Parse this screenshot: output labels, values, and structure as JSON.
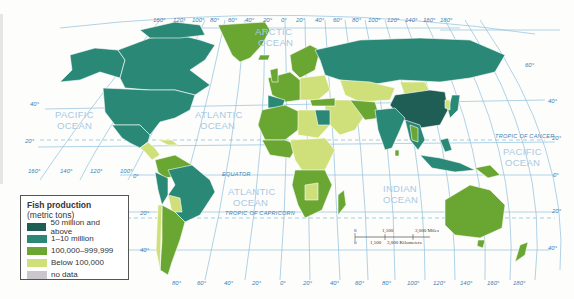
{
  "legend": {
    "title_line1": "Fish production",
    "title_line2": "(metric tons)",
    "items": [
      {
        "label": "50 million and above",
        "color": "#1e5e55"
      },
      {
        "label": "1–10 million",
        "color": "#2a8877"
      },
      {
        "label": "100,000–999,999",
        "color": "#6aa632"
      },
      {
        "label": "Below 100,000",
        "color": "#cfe07a"
      },
      {
        "label": "no data",
        "color": "#c9c7cc"
      }
    ]
  },
  "oceans": {
    "arctic_1": "ARCTIC",
    "arctic_2": "OCEAN",
    "pacific_w_1": "PACIFIC",
    "pacific_w_2": "OCEAN",
    "atlantic_n_1": "ATLANTIC",
    "atlantic_n_2": "OCEAN",
    "atlantic_s_1": "ATLANTIC",
    "atlantic_s_2": "OCEAN",
    "indian_1": "INDIAN",
    "indian_2": "OCEAN",
    "pacific_e_1": "PACIFIC",
    "pacific_e_2": "OCEAN"
  },
  "lines": {
    "equator": "EQUATOR",
    "tropic_cancer": "TROPIC OF CANCER",
    "tropic_capricorn": "TROPIC OF CAPRICORN"
  },
  "top_longitudes": [
    "160°",
    "120°",
    "100°",
    "80°",
    "60°",
    "40°",
    "20°",
    "0°",
    "20°",
    "40°",
    "60°",
    "80°",
    "100°",
    "120°",
    "140°",
    "160°",
    "180°"
  ],
  "bottom_longitudes": [
    "80°",
    "60°",
    "40°",
    "20°",
    "0°",
    "20°",
    "40°",
    "60°",
    "80°",
    "100°",
    "120°",
    "140°",
    "160°",
    "180°"
  ],
  "mid_longitudes": [
    "160°",
    "140°",
    "120°",
    "100°"
  ],
  "left_latitudes": [
    "40°",
    "20°",
    "0°",
    "20°",
    "40°"
  ],
  "right_latitudes": [
    "60°",
    "40°",
    "20°",
    "0°",
    "20°",
    "40°"
  ],
  "scale": {
    "miles": [
      "0",
      "1,500",
      "3,000 Miles"
    ],
    "km": [
      "0",
      "1,500",
      "3,000 Kilometers"
    ]
  }
}
